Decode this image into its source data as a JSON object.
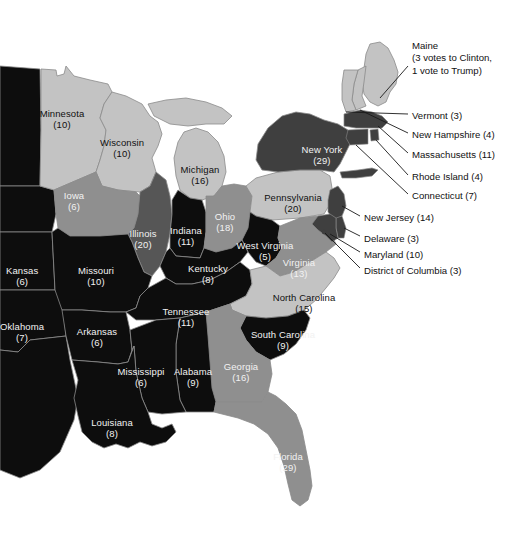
{
  "map": {
    "title": "United States Electoral College Map (Eastern States)",
    "background_color": "#ffffff",
    "water_color": "#ffffff",
    "border_color": "#8a8a8a",
    "palette": {
      "black": "#0d0d0d",
      "dark_gray": "#3f3f3f",
      "mid_dark_gray": "#565656",
      "mid_gray": "#8f8f8f",
      "light_gray": "#c3c3c3",
      "lighter_gray": "#d6d6d6"
    }
  },
  "states": [
    {
      "name": "Minnesota",
      "votes": "(10)",
      "shade": "light_gray",
      "text": "dark",
      "x": 62,
      "y": 109,
      "id": "mn"
    },
    {
      "name": "Wisconsin",
      "votes": "(10)",
      "shade": "light_gray",
      "text": "dark",
      "x": 122,
      "y": 138,
      "id": "wi"
    },
    {
      "name": "Michigan",
      "votes": "(16)",
      "shade": "light_gray",
      "text": "dark",
      "x": 200,
      "y": 165,
      "id": "mi"
    },
    {
      "name": "Iowa",
      "votes": "(6)",
      "shade": "mid_gray",
      "text": "light",
      "x": 74,
      "y": 191,
      "id": "ia"
    },
    {
      "name": "Illinois",
      "votes": "(20)",
      "shade": "mid_dark_gray",
      "text": "light",
      "x": 143,
      "y": 229,
      "id": "il"
    },
    {
      "name": "Indiana",
      "votes": "(11)",
      "shade": "black",
      "text": "light",
      "x": 186,
      "y": 226,
      "id": "in"
    },
    {
      "name": "Ohio",
      "votes": "(18)",
      "shade": "mid_gray",
      "text": "light",
      "x": 225,
      "y": 212,
      "id": "oh"
    },
    {
      "name": "Pennsylvania",
      "votes": "(20)",
      "shade": "light_gray",
      "text": "dark",
      "x": 293,
      "y": 193,
      "id": "pa"
    },
    {
      "name": "New York",
      "votes": "(29)",
      "shade": "dark_gray",
      "text": "light",
      "x": 322,
      "y": 145,
      "id": "ny"
    },
    {
      "name": "West Virginia",
      "votes": "(5)",
      "shade": "black",
      "text": "light",
      "x": 265,
      "y": 241,
      "id": "wv"
    },
    {
      "name": "Virginia",
      "votes": "(13)",
      "shade": "mid_gray",
      "text": "light",
      "x": 299,
      "y": 258,
      "id": "va"
    },
    {
      "name": "Kentucky",
      "votes": "(8)",
      "shade": "black",
      "text": "light",
      "x": 208,
      "y": 264,
      "id": "ky"
    },
    {
      "name": "Missouri",
      "votes": "(10)",
      "shade": "black",
      "text": "light",
      "x": 96,
      "y": 266,
      "id": "mo"
    },
    {
      "name": "Kansas",
      "votes": "(6)",
      "shade": "black",
      "text": "light",
      "x": 6,
      "y": 266,
      "id": "ks",
      "clipped": true
    },
    {
      "name": "Oklahoma",
      "votes": "(7)",
      "shade": "black",
      "text": "light",
      "x": 22,
      "y": 322,
      "id": "ok"
    },
    {
      "name": "Arkansas",
      "votes": "(6)",
      "shade": "black",
      "text": "light",
      "x": 97,
      "y": 327,
      "id": "ar"
    },
    {
      "name": "Tennessee",
      "votes": "(11)",
      "shade": "black",
      "text": "light",
      "x": 186,
      "y": 307,
      "id": "tn"
    },
    {
      "name": "North Carolina",
      "votes": "(15)",
      "shade": "light_gray",
      "text": "dark",
      "x": 304,
      "y": 293,
      "id": "nc"
    },
    {
      "name": "South Carolina",
      "votes": "(9)",
      "shade": "black",
      "text": "light",
      "x": 283,
      "y": 330,
      "id": "sc"
    },
    {
      "name": "Mississippi",
      "votes": "(6)",
      "shade": "black",
      "text": "light",
      "x": 141,
      "y": 367,
      "id": "ms"
    },
    {
      "name": "Alabama",
      "votes": "(9)",
      "shade": "black",
      "text": "light",
      "x": 193,
      "y": 367,
      "id": "al"
    },
    {
      "name": "Georgia",
      "votes": "(16)",
      "shade": "mid_gray",
      "text": "light",
      "x": 241,
      "y": 362,
      "id": "ga"
    },
    {
      "name": "Louisiana",
      "votes": "(8)",
      "shade": "black",
      "text": "light",
      "x": 112,
      "y": 418,
      "id": "la"
    },
    {
      "name": "Florida",
      "votes": "(29)",
      "shade": "mid_gray",
      "text": "light",
      "x": 288,
      "y": 452,
      "id": "fl"
    }
  ],
  "callouts": [
    {
      "label": "Maine",
      "votes": "",
      "lines": [
        "Maine",
        "(3 votes to Clinton,",
        "1 vote to Trump)"
      ],
      "x": 412,
      "y": 40,
      "id": "me"
    },
    {
      "label": "Vermont (3)",
      "votes": "(3)",
      "lines": [
        "Vermont (3)"
      ],
      "x": 412,
      "y": 110,
      "id": "vt"
    },
    {
      "label": "New Hampshire (4)",
      "votes": "(4)",
      "lines": [
        "New Hampshire (4)"
      ],
      "x": 412,
      "y": 129,
      "id": "nh"
    },
    {
      "label": "Massachusetts (11)",
      "votes": "(11)",
      "lines": [
        "Massachusetts (11)"
      ],
      "x": 412,
      "y": 149,
      "id": "ma"
    },
    {
      "label": "Rhode Island (4)",
      "votes": "(4)",
      "lines": [
        "Rhode Island (4)"
      ],
      "x": 412,
      "y": 171,
      "id": "ri"
    },
    {
      "label": "Connecticut (7)",
      "votes": "(7)",
      "lines": [
        "Connecticut (7)"
      ],
      "x": 412,
      "y": 190,
      "id": "ct"
    },
    {
      "label": "New Jersey (14)",
      "votes": "(14)",
      "lines": [
        "New Jersey (14)"
      ],
      "x": 364,
      "y": 212,
      "id": "nj"
    },
    {
      "label": "Delaware (3)",
      "votes": "(3)",
      "lines": [
        "Delaware (3)"
      ],
      "x": 364,
      "y": 233,
      "id": "de"
    },
    {
      "label": "Maryland (10)",
      "votes": "(10)",
      "lines": [
        "Maryland (10)"
      ],
      "x": 364,
      "y": 249,
      "id": "md"
    },
    {
      "label": "District of Columbia (3)",
      "votes": "(3)",
      "lines": [
        "District of Columbia (3)"
      ],
      "x": 364,
      "y": 265,
      "id": "dc"
    }
  ],
  "chart_data": {
    "type": "map",
    "legend": [],
    "entries": [
      {
        "state": "Minnesota",
        "votes": 10
      },
      {
        "state": "Wisconsin",
        "votes": 10
      },
      {
        "state": "Michigan",
        "votes": 16
      },
      {
        "state": "Iowa",
        "votes": 6
      },
      {
        "state": "Illinois",
        "votes": 20
      },
      {
        "state": "Indiana",
        "votes": 11
      },
      {
        "state": "Ohio",
        "votes": 18
      },
      {
        "state": "Pennsylvania",
        "votes": 20
      },
      {
        "state": "New York",
        "votes": 29
      },
      {
        "state": "West Virginia",
        "votes": 5
      },
      {
        "state": "Virginia",
        "votes": 13
      },
      {
        "state": "Kentucky",
        "votes": 8
      },
      {
        "state": "Missouri",
        "votes": 10
      },
      {
        "state": "Kansas",
        "votes": 6
      },
      {
        "state": "Oklahoma",
        "votes": 7
      },
      {
        "state": "Arkansas",
        "votes": 6
      },
      {
        "state": "Tennessee",
        "votes": 11
      },
      {
        "state": "North Carolina",
        "votes": 15
      },
      {
        "state": "South Carolina",
        "votes": 9
      },
      {
        "state": "Mississippi",
        "votes": 6
      },
      {
        "state": "Alabama",
        "votes": 9
      },
      {
        "state": "Georgia",
        "votes": 16
      },
      {
        "state": "Louisiana",
        "votes": 8
      },
      {
        "state": "Florida",
        "votes": 29
      },
      {
        "state": "Maine",
        "votes": 4,
        "note": "3 votes to Clinton, 1 vote to Trump"
      },
      {
        "state": "Vermont",
        "votes": 3
      },
      {
        "state": "New Hampshire",
        "votes": 4
      },
      {
        "state": "Massachusetts",
        "votes": 11
      },
      {
        "state": "Rhode Island",
        "votes": 4
      },
      {
        "state": "Connecticut",
        "votes": 7
      },
      {
        "state": "New Jersey",
        "votes": 14
      },
      {
        "state": "Delaware",
        "votes": 3
      },
      {
        "state": "Maryland",
        "votes": 10
      },
      {
        "state": "District of Columbia",
        "votes": 3
      }
    ]
  }
}
